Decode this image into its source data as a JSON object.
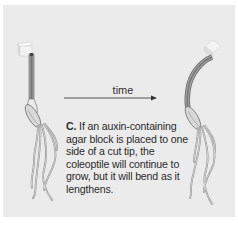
{
  "diagram": {
    "arrow_label": "time",
    "caption": {
      "label": "C.",
      "text": "If an auxin-containing agar block is placed to one side of a cut tip, the coleoptile will continue to grow, but it will bend as it lengthens."
    },
    "stages": [
      {
        "name": "before",
        "description": "straight coleoptile with auxin agar block placed on one side of cut tip"
      },
      {
        "name": "after",
        "description": "coleoptile bent away from side with agar block after time passes"
      }
    ],
    "colors": {
      "background": "#ebebeb",
      "stem": "#8a8a8a",
      "stem_inner": "#555555",
      "agar_block": "#f3f3f3",
      "outline": "#777777",
      "text": "#2b2b2b"
    }
  }
}
